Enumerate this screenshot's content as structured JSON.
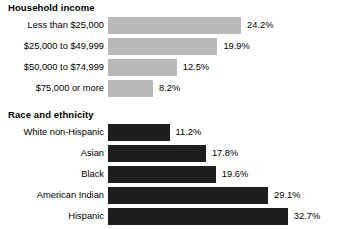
{
  "chart_data": {
    "type": "bar",
    "orientation": "horizontal",
    "title": "",
    "xlabel": "",
    "ylabel": "",
    "xlim": [
      0,
      35
    ],
    "grid": false,
    "legend": false,
    "value_suffix": "%",
    "panels": [
      {
        "title": "Household income",
        "bar_color": "#b9b9b9",
        "categories": [
          "Less than $25,000",
          "$25,000 to $49,999",
          "$50,000 to $74,999",
          "$75,000 or more"
        ],
        "values": [
          24.2,
          19.9,
          12.5,
          8.2
        ],
        "labels": [
          "24.2%",
          "19.9%",
          "12.5%",
          "8.2%"
        ]
      },
      {
        "title": "Race and ethnicity",
        "bar_color": "#1e1e1e",
        "categories": [
          "White non-Hispanic",
          "Asian",
          "Black",
          "American Indian",
          "Hispanic"
        ],
        "values": [
          11.2,
          17.8,
          19.6,
          29.1,
          32.7
        ],
        "labels": [
          "11.2%",
          "17.8%",
          "19.6%",
          "29.1%",
          "32.7%"
        ]
      }
    ]
  }
}
